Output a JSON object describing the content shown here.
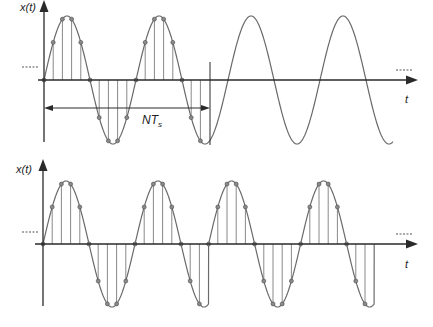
{
  "figure": {
    "colors": {
      "axis": "#2a2a2a",
      "wave": "#6a6a6a",
      "stem": "#7a7a7a",
      "sample": "#8a8a8a"
    },
    "top_plot": {
      "y_label": "x(t)",
      "x_label": "t",
      "ellipsis_left": "......",
      "ellipsis_right": "......",
      "window_label": "NT",
      "window_label_sub": "s",
      "samples_per_period": 10,
      "num_samples_N": 18,
      "periods_shown": 3.8,
      "signal": "continuous sine with samples over first N samples"
    },
    "bottom_plot": {
      "y_label": "x(t)",
      "x_label": "t",
      "ellipsis_left": "......",
      "ellipsis_right": "......",
      "samples_per_period": 10,
      "num_samples_N": 18,
      "repetitions": 2,
      "signal": "periodic repetition of the N-sample window (discontinuous at boundary)"
    }
  }
}
